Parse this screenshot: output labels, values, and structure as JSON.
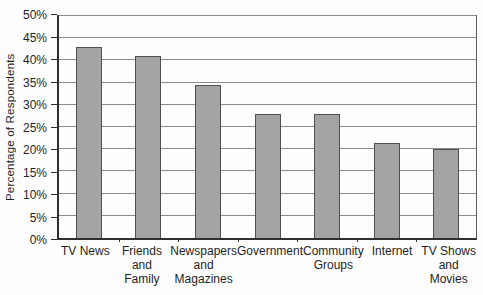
{
  "chart_data": {
    "type": "bar",
    "title": "",
    "xlabel": "",
    "ylabel": "Percentage of Respondents",
    "categories": [
      "TV News",
      "Friends and Family",
      "Newspapers and Magazines",
      "Government",
      "Community Groups",
      "Internet",
      "TV Shows and Movies"
    ],
    "categories_wrapped": [
      [
        "TV News"
      ],
      [
        "Friends",
        "and",
        "Family"
      ],
      [
        "Newspapers",
        "and",
        "Magazines"
      ],
      [
        "Government"
      ],
      [
        "Community",
        "Groups"
      ],
      [
        "Internet"
      ],
      [
        "TV Shows",
        "and",
        "Movies"
      ]
    ],
    "values": [
      43,
      41,
      34.5,
      28,
      28,
      21.5,
      20
    ],
    "ylim": [
      0,
      50
    ],
    "ytick_step": 5,
    "ytick_labels": [
      "0%",
      "5%",
      "10%",
      "15%",
      "20%",
      "25%",
      "30%",
      "35%",
      "40%",
      "45%",
      "50%"
    ],
    "grid": true,
    "legend": "none",
    "colors": {
      "bar_fill": "#a4a4a4",
      "bar_border": "#505050",
      "gridline": "#8c8c8c",
      "axis": "#2f2f2f",
      "text": "#1f1f1f",
      "background": "#fdfdfd"
    }
  }
}
